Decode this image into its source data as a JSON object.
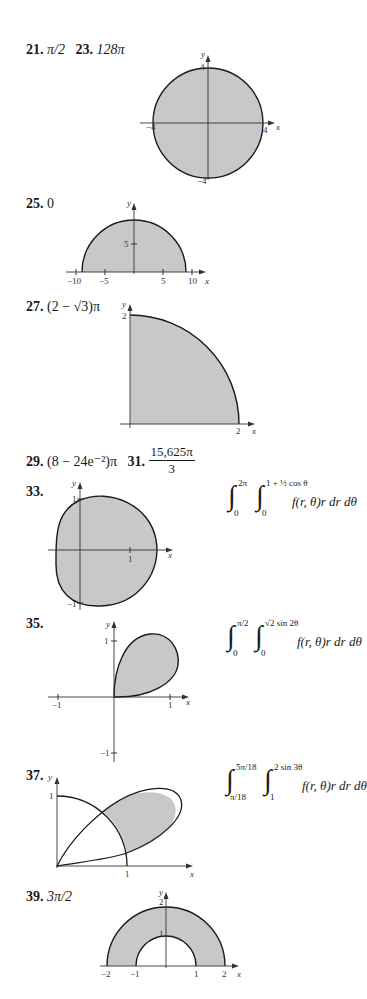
{
  "problems": [
    {
      "number": "21.",
      "answer": "π/2"
    },
    {
      "number": "23.",
      "answer": "128π",
      "graph": {
        "type": "disk",
        "radius": 4,
        "x_ticks": [
          "−4",
          "4"
        ],
        "y_ticks": [
          "4",
          "−4"
        ],
        "x_label": "x",
        "y_label": "y"
      }
    },
    {
      "number": "25.",
      "answer": "0",
      "graph": {
        "type": "half-disk",
        "radius": 9,
        "x_ticks": [
          "−10",
          "−5",
          "5",
          "10"
        ],
        "y_ticks": [
          "5"
        ],
        "x_label": "x",
        "y_label": "y"
      }
    },
    {
      "number": "27.",
      "answer": "(2 − √3)π",
      "graph": {
        "type": "quarter-disk",
        "radius": 2,
        "x_ticks": [
          "2"
        ],
        "y_ticks": [
          "2"
        ],
        "x_label": "x",
        "y_label": "y"
      }
    },
    {
      "number": "29.",
      "answer": "(8 − 24e⁻²)π"
    },
    {
      "number": "31.",
      "answer_numerator": "15,625π",
      "answer_denominator": "3"
    },
    {
      "number": "33.",
      "graph": {
        "type": "limacon",
        "x_ticks": [
          "1"
        ],
        "y_ticks": [
          "1",
          "−1"
        ],
        "x_label": "x",
        "y_label": "y"
      },
      "integral": {
        "outer_lower": "0",
        "outer_upper": "2π",
        "inner_lower": "0",
        "inner_upper": "1 + ½ cos θ",
        "integrand": "f(r, θ)r dr dθ"
      }
    },
    {
      "number": "35.",
      "graph": {
        "type": "lemniscate-loop",
        "x_ticks": [
          "−1",
          "1"
        ],
        "y_ticks": [
          "1",
          "−1"
        ],
        "x_label": "x",
        "y_label": "y"
      },
      "integral": {
        "outer_lower": "0",
        "outer_upper": "π/2",
        "inner_lower": "0",
        "inner_upper": "√2 sin 2θ",
        "integrand": "f(r, θ)r dr dθ"
      }
    },
    {
      "number": "37.",
      "graph": {
        "type": "rose-petal-outside-circle",
        "x_ticks": [
          "1"
        ],
        "y_ticks": [
          "1"
        ],
        "x_label": "x",
        "y_label": "y"
      },
      "integral": {
        "outer_lower": "π/18",
        "outer_upper": "5π/18",
        "inner_lower": "1",
        "inner_upper": "2 sin 3θ",
        "integrand": "f(r, θ)r dr dθ"
      }
    },
    {
      "number": "39.",
      "answer": "3π/2",
      "graph": {
        "type": "half-annulus",
        "x_ticks": [
          "−2",
          "−1",
          "1",
          "2"
        ],
        "y_ticks": [
          "2",
          "1"
        ],
        "x_label": "x",
        "y_label": "y"
      }
    }
  ],
  "colors": {
    "fill": "#c8c8c8",
    "stroke": "#1a1a1a",
    "axis": "#333333"
  }
}
